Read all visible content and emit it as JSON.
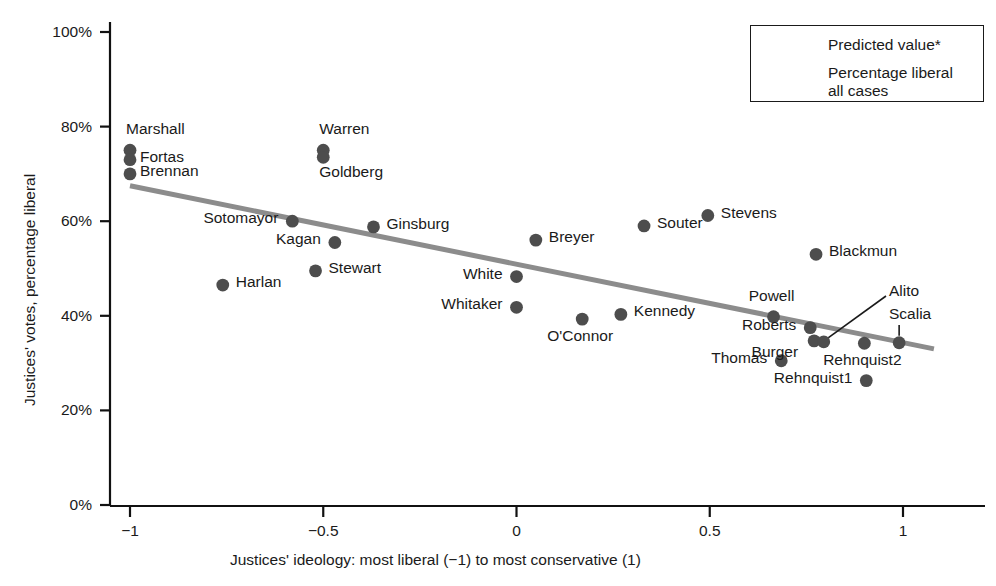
{
  "chart_data": {
    "type": "scatter",
    "title": "",
    "xlabel": "Justices' ideology: most liberal (−1) to most conservative (1)",
    "ylabel": "Justices' votes, percentage liberal",
    "xlim": [
      -1.1,
      1.08
    ],
    "ylim": [
      0,
      100
    ],
    "xticks": [
      "−1",
      "−0.5",
      "0",
      "0.5",
      "1"
    ],
    "xtick_values": [
      -1,
      -0.5,
      0,
      0.5,
      1
    ],
    "yticks": [
      "0%",
      "20%",
      "40%",
      "60%",
      "80%",
      "100%"
    ],
    "ytick_values": [
      0,
      20,
      40,
      60,
      80,
      100
    ],
    "grid": false,
    "legend_position": "top-right",
    "legend": [
      {
        "key": "predicted-line",
        "marker": "line",
        "label": "Predicted value*"
      },
      {
        "key": "percentage-liberal",
        "marker": "dot",
        "label": "Percentage liberal\nall cases"
      }
    ],
    "legend_entries": [
      {
        "label": "Predicted value*"
      },
      {
        "label_line1": "Percentage liberal",
        "label_line2": "all cases"
      }
    ],
    "series": [
      {
        "name": "Percentage liberal all cases",
        "marker_color": "#4d4d4d",
        "points": [
          {
            "name": "Marshall",
            "x": -1.0,
            "y": 75.0,
            "label_dx": -4,
            "label_dy": -26,
            "label_anchor": "start"
          },
          {
            "name": "Fortas",
            "x": -1.0,
            "y": 73.0,
            "label_dx": 10,
            "label_dy": -8,
            "label_anchor": "start"
          },
          {
            "name": "Brennan",
            "x": -1.0,
            "y": 70.0,
            "label_dx": 10,
            "label_dy": -8,
            "label_anchor": "start"
          },
          {
            "name": "Warren",
            "x": -0.5,
            "y": 75.0,
            "label_dx": -4,
            "label_dy": -26,
            "label_anchor": "start"
          },
          {
            "name": "Goldberg",
            "x": -0.5,
            "y": 73.5,
            "label_dx": -4,
            "label_dy": 10,
            "label_anchor": "start"
          },
          {
            "name": "Sotomayor",
            "x": -0.58,
            "y": 60.0,
            "label_dx": -14,
            "label_dy": -8,
            "label_anchor": "end"
          },
          {
            "name": "Kagan",
            "x": -0.47,
            "y": 55.5,
            "label_dx": -14,
            "label_dy": -8,
            "label_anchor": "end"
          },
          {
            "name": "Ginsburg",
            "x": -0.37,
            "y": 58.8,
            "label_dx": 13,
            "label_dy": -8,
            "label_anchor": "start"
          },
          {
            "name": "Stewart",
            "x": -0.52,
            "y": 49.5,
            "label_dx": 13,
            "label_dy": -8,
            "label_anchor": "start"
          },
          {
            "name": "Harlan",
            "x": -0.76,
            "y": 46.5,
            "label_dx": 13,
            "label_dy": -8,
            "label_anchor": "start"
          },
          {
            "name": "Breyer",
            "x": 0.05,
            "y": 56.0,
            "label_dx": 13,
            "label_dy": -8,
            "label_anchor": "start"
          },
          {
            "name": "White",
            "x": 0.0,
            "y": 48.3,
            "label_dx": -14,
            "label_dy": -8,
            "label_anchor": "end"
          },
          {
            "name": "Whitaker",
            "x": 0.0,
            "y": 41.8,
            "label_dx": -14,
            "label_dy": -8,
            "label_anchor": "end"
          },
          {
            "name": "O'Connor",
            "x": 0.17,
            "y": 39.3,
            "label_dx": -2,
            "label_dy": 12,
            "label_anchor": "middle"
          },
          {
            "name": "Kennedy",
            "x": 0.27,
            "y": 40.3,
            "label_dx": 13,
            "label_dy": -8,
            "label_anchor": "start"
          },
          {
            "name": "Souter",
            "x": 0.33,
            "y": 59.0,
            "label_dx": 13,
            "label_dy": -8,
            "label_anchor": "start"
          },
          {
            "name": "Stevens",
            "x": 0.495,
            "y": 61.2,
            "label_dx": 13,
            "label_dy": -8,
            "label_anchor": "start"
          },
          {
            "name": "Blackmun",
            "x": 0.775,
            "y": 53.0,
            "label_dx": 13,
            "label_dy": -8,
            "label_anchor": "start"
          },
          {
            "name": "Powell",
            "x": 0.665,
            "y": 39.8,
            "label_dx": -2,
            "label_dy": -26,
            "label_anchor": "middle"
          },
          {
            "name": "Roberts",
            "x": 0.76,
            "y": 37.5,
            "label_dx": -14,
            "label_dy": -8,
            "label_anchor": "end"
          },
          {
            "name": "Burger",
            "x": 0.77,
            "y": 34.7,
            "label_dx": -16,
            "label_dy": 6,
            "label_anchor": "end"
          },
          {
            "name": "Alito",
            "x": 0.795,
            "y": 34.5,
            "label_dx": 0,
            "label_dy": 0,
            "label_anchor": "leader"
          },
          {
            "name": "Thomas",
            "x": 0.685,
            "y": 30.5,
            "label_dx": -14,
            "label_dy": -8,
            "label_anchor": "end"
          },
          {
            "name": "Rehnquist2",
            "x": 0.9,
            "y": 34.2,
            "label_dx": -2,
            "label_dy": 12,
            "label_anchor": "middle"
          },
          {
            "name": "Rehnquist1",
            "x": 0.905,
            "y": 26.3,
            "label_dx": -14,
            "label_dy": -8,
            "label_anchor": "end"
          },
          {
            "name": "Scalia",
            "x": 0.99,
            "y": 34.3,
            "label_dx": 0,
            "label_dy": 0,
            "label_anchor": "leader"
          }
        ]
      }
    ],
    "trend_line": {
      "name": "Predicted value*",
      "color": "#8c8c8c",
      "x_start": -1.0,
      "y_start": 67.5,
      "x_end": 1.08,
      "y_end": 33.0
    }
  }
}
